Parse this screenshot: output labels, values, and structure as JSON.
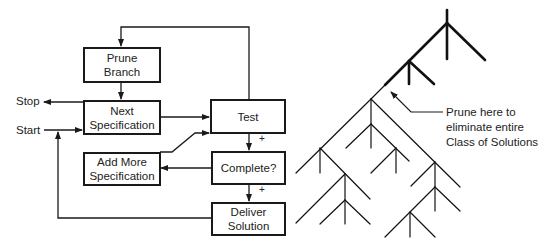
{
  "flowchart": {
    "boxes": {
      "prune_branch": [
        "Prune",
        "Branch"
      ],
      "next_spec": [
        "Next",
        "Specification"
      ],
      "test": [
        "Test"
      ],
      "add_more": [
        "Add More",
        "Specification"
      ],
      "complete": [
        "Complete?"
      ],
      "deliver": [
        "Deliver",
        "Solution"
      ]
    },
    "labels": {
      "stop": "Stop",
      "start": "Start",
      "plus1": "+",
      "plus2": "+"
    }
  },
  "tree": {
    "annotation": [
      "Prune here to",
      "eliminate entire",
      "Class of Solutions"
    ]
  }
}
